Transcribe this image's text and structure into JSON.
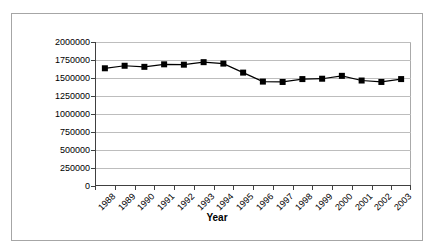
{
  "title": {
    "text": "",
    "note": "cropped"
  },
  "axis_titles": {
    "x": "Year",
    "y": ""
  },
  "chart_data": {
    "type": "line",
    "title": "",
    "xlabel": "Year",
    "ylabel": "",
    "ylim": [
      0,
      2000000
    ],
    "yticks": [
      0,
      250000,
      500000,
      750000,
      1000000,
      1250000,
      1500000,
      1750000,
      2000000
    ],
    "ytick_labels": [
      "0",
      "250000",
      "500000",
      "750000",
      "1000000",
      "1250000",
      "1500000",
      "1750000",
      "2000000"
    ],
    "grid": "horizontal",
    "legend": "none",
    "marker": "filled-square",
    "line_color": "#000000",
    "marker_color": "#000000",
    "categories": [
      "1988",
      "1989",
      "1990",
      "1991",
      "1992",
      "1993",
      "1994",
      "1995",
      "1996",
      "1997",
      "1998",
      "1999",
      "2000",
      "2001",
      "2002",
      "2003"
    ],
    "values": [
      1635000,
      1670000,
      1655000,
      1690000,
      1685000,
      1720000,
      1700000,
      1575000,
      1450000,
      1445000,
      1485000,
      1490000,
      1530000,
      1465000,
      1445000,
      1485000
    ]
  }
}
